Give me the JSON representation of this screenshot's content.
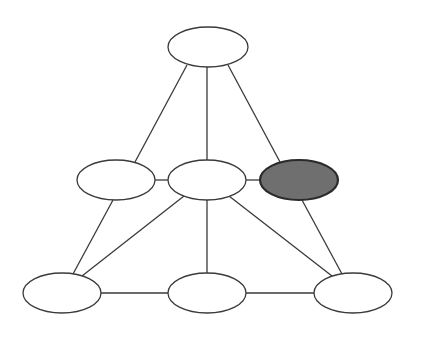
{
  "diagram": {
    "type": "graph",
    "width": 422,
    "height": 338,
    "colors": {
      "background": "#ffffff",
      "node_fill": "#ffffff",
      "node_stroke": "#3a3a3a",
      "highlight_fill": "#6f6f6f",
      "highlight_stroke": "#2a2a2a",
      "edge": "#3a3a3a"
    },
    "nodes": [
      {
        "id": "top",
        "cx": 208,
        "cy": 47,
        "rx": 40,
        "ry": 20,
        "highlighted": false
      },
      {
        "id": "mid-left",
        "cx": 116,
        "cy": 180,
        "rx": 39,
        "ry": 20,
        "highlighted": false
      },
      {
        "id": "mid-center",
        "cx": 207,
        "cy": 180,
        "rx": 39,
        "ry": 20,
        "highlighted": false
      },
      {
        "id": "mid-right",
        "cx": 299,
        "cy": 180,
        "rx": 39,
        "ry": 20,
        "highlighted": true
      },
      {
        "id": "bottom-left",
        "cx": 62,
        "cy": 293,
        "rx": 39,
        "ry": 20,
        "highlighted": false
      },
      {
        "id": "bottom-center",
        "cx": 207,
        "cy": 293,
        "rx": 39,
        "ry": 20,
        "highlighted": false
      },
      {
        "id": "bottom-right",
        "cx": 353,
        "cy": 293,
        "rx": 39,
        "ry": 20,
        "highlighted": false
      }
    ],
    "edges": [
      {
        "from": "top",
        "to": "mid-left",
        "x1": 187,
        "y1": 65,
        "x2": 135,
        "y2": 162
      },
      {
        "from": "top",
        "to": "mid-center",
        "x1": 207,
        "y1": 67,
        "x2": 207,
        "y2": 160
      },
      {
        "from": "top",
        "to": "mid-right",
        "x1": 228,
        "y1": 65,
        "x2": 280,
        "y2": 162
      },
      {
        "from": "mid-left",
        "to": "mid-center",
        "x1": 155,
        "y1": 180,
        "x2": 168,
        "y2": 180
      },
      {
        "from": "mid-center",
        "to": "mid-right",
        "x1": 246,
        "y1": 180,
        "x2": 260,
        "y2": 180
      },
      {
        "from": "mid-left",
        "to": "bottom-left",
        "x1": 113,
        "y1": 200,
        "x2": 73,
        "y2": 274
      },
      {
        "from": "mid-center",
        "to": "bottom-left",
        "x1": 184,
        "y1": 196,
        "x2": 82,
        "y2": 276
      },
      {
        "from": "mid-center",
        "to": "bottom-center",
        "x1": 207,
        "y1": 200,
        "x2": 207,
        "y2": 273
      },
      {
        "from": "mid-center",
        "to": "bottom-right",
        "x1": 229,
        "y1": 196,
        "x2": 332,
        "y2": 276
      },
      {
        "from": "mid-right",
        "to": "bottom-right",
        "x1": 302,
        "y1": 200,
        "x2": 342,
        "y2": 274
      },
      {
        "from": "bottom-left",
        "to": "bottom-center",
        "x1": 101,
        "y1": 293,
        "x2": 168,
        "y2": 293
      },
      {
        "from": "bottom-center",
        "to": "bottom-right",
        "x1": 246,
        "y1": 293,
        "x2": 314,
        "y2": 293
      }
    ]
  }
}
